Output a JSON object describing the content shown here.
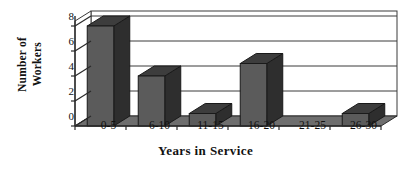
{
  "chart_data": {
    "type": "bar",
    "title": "",
    "subtitle": "",
    "xlabel": "Years in Service",
    "ylabel_line1": "Number of",
    "ylabel_line2": "Workers",
    "ylabel": "Number of Workers",
    "categories": [
      "0-5",
      "6-10",
      "11-15",
      "16-20",
      "21-25",
      "26-30"
    ],
    "values": [
      8,
      4,
      1,
      5,
      0,
      1
    ],
    "ylim": [
      0,
      8
    ],
    "yticks": [
      0,
      2,
      4,
      6,
      8
    ],
    "ytick_labels": [
      "0",
      "2",
      "4",
      "6",
      "8"
    ],
    "grid": true,
    "grid_axis": "y",
    "legend": false,
    "legend_position": "none",
    "style": "3d-column",
    "colors": {
      "bar_front": "#5b5b5b",
      "bar_top": "#3d3d3d",
      "bar_side": "#2e2e2e",
      "floor": "#6e6e6e",
      "wall": "#ffffff",
      "gridline": "#3a3a3a",
      "axis": "#2a2a2a",
      "text": "#111111",
      "background": "#ffffff"
    }
  },
  "annotations": []
}
